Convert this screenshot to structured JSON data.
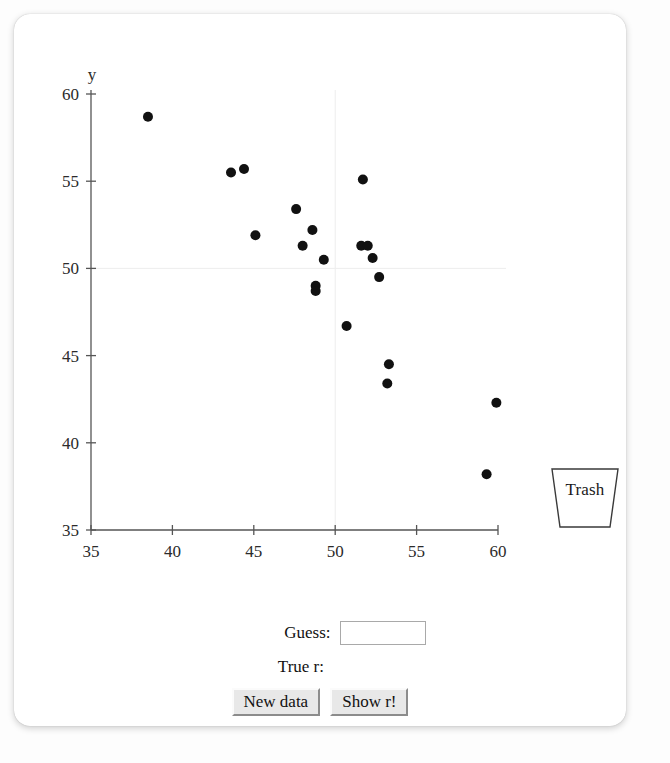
{
  "app": {
    "title": "Guess the Correlation"
  },
  "chart_data": {
    "type": "scatter",
    "title": "",
    "xlabel": "x",
    "ylabel": "y",
    "xlim": [
      35,
      60
    ],
    "ylim": [
      35,
      60
    ],
    "xticks": [
      35,
      40,
      45,
      50,
      55,
      60
    ],
    "yticks": [
      35,
      40,
      45,
      50,
      55,
      60
    ],
    "grid": true,
    "gridlines": {
      "x": [
        50
      ],
      "y": [
        50
      ]
    },
    "marker": {
      "shape": "circle",
      "color": "#111111",
      "size": 5
    },
    "points": [
      {
        "x": 38.5,
        "y": 58.7
      },
      {
        "x": 43.6,
        "y": 55.5
      },
      {
        "x": 44.4,
        "y": 55.7
      },
      {
        "x": 45.1,
        "y": 51.9
      },
      {
        "x": 47.6,
        "y": 53.4
      },
      {
        "x": 48.0,
        "y": 51.3
      },
      {
        "x": 48.6,
        "y": 52.2
      },
      {
        "x": 48.8,
        "y": 49.0
      },
      {
        "x": 48.8,
        "y": 48.7
      },
      {
        "x": 49.3,
        "y": 50.5
      },
      {
        "x": 50.7,
        "y": 46.7
      },
      {
        "x": 51.6,
        "y": 51.3
      },
      {
        "x": 52.0,
        "y": 51.3
      },
      {
        "x": 51.7,
        "y": 55.1
      },
      {
        "x": 52.3,
        "y": 50.6
      },
      {
        "x": 52.7,
        "y": 49.5
      },
      {
        "x": 53.3,
        "y": 44.5
      },
      {
        "x": 53.2,
        "y": 43.4
      },
      {
        "x": 59.9,
        "y": 42.3
      },
      {
        "x": 59.3,
        "y": 38.2
      }
    ]
  },
  "trash": {
    "label": "Trash"
  },
  "controls": {
    "guess_label": "Guess:",
    "guess_value": "",
    "guess_placeholder": "",
    "true_r_label": "True r:",
    "true_r_value": "",
    "new_data_label": "New data",
    "show_r_label": "Show r!"
  }
}
